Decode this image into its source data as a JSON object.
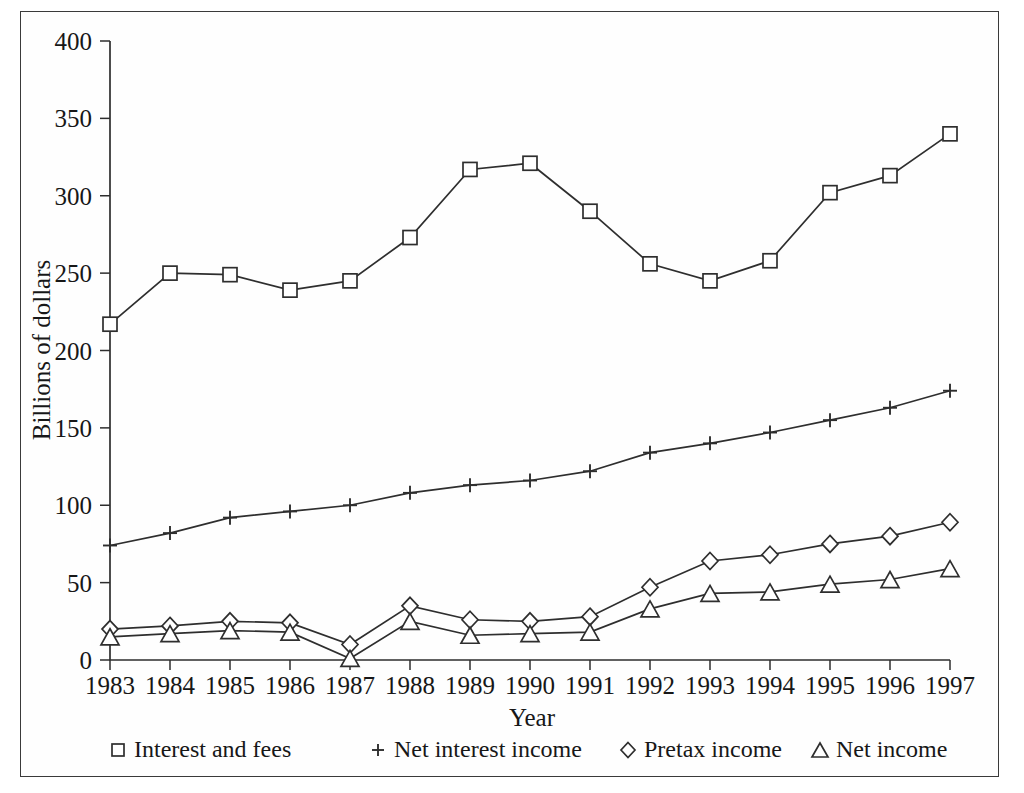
{
  "figure": {
    "y_axis_title": "Billions of dollars",
    "x_axis_title": "Year",
    "frame_color": "#3a3a3a",
    "line_color": "#2e2e2e",
    "background": "#ffffff"
  },
  "legend": {
    "position": "bottom",
    "entries": [
      {
        "label": "Interest and fees",
        "marker": "square-marker"
      },
      {
        "label": "Net interest income",
        "marker": "plus-marker"
      },
      {
        "label": "Pretax income",
        "marker": "diamond-marker"
      },
      {
        "label": "Net income",
        "marker": "triangle-marker"
      }
    ]
  },
  "axes": {
    "y_ticks": [
      "0",
      "50",
      "100",
      "150",
      "200",
      "250",
      "300",
      "350",
      "400"
    ],
    "x_ticks": [
      "1983",
      "1984",
      "1985",
      "1986",
      "1987",
      "1988",
      "1989",
      "1990",
      "1991",
      "1992",
      "1993",
      "1994",
      "1995",
      "1996",
      "1997"
    ]
  },
  "chart_data": {
    "type": "line",
    "title": "",
    "xlabel": "Year",
    "ylabel": "Billions of dollars",
    "x": [
      1983,
      1984,
      1985,
      1986,
      1987,
      1988,
      1989,
      1990,
      1991,
      1992,
      1993,
      1994,
      1995,
      1996,
      1997
    ],
    "categories": [
      "1983",
      "1984",
      "1985",
      "1986",
      "1987",
      "1988",
      "1989",
      "1990",
      "1991",
      "1992",
      "1993",
      "1994",
      "1995",
      "1996",
      "1997"
    ],
    "ylim": [
      0,
      400
    ],
    "xlim": [
      1983,
      1997
    ],
    "yticks": [
      0,
      50,
      100,
      150,
      200,
      250,
      300,
      350,
      400
    ],
    "grid": false,
    "legend_position": "bottom",
    "series": [
      {
        "name": "Interest and fees",
        "marker": "square",
        "values": [
          217,
          250,
          249,
          239,
          245,
          273,
          317,
          321,
          290,
          256,
          245,
          258,
          302,
          313,
          340
        ]
      },
      {
        "name": "Net interest income",
        "marker": "plus",
        "values": [
          74,
          82,
          92,
          96,
          100,
          108,
          113,
          116,
          122,
          134,
          140,
          147,
          155,
          163,
          174
        ]
      },
      {
        "name": "Pretax income",
        "marker": "diamond",
        "values": [
          20,
          22,
          25,
          24,
          10,
          35,
          26,
          25,
          28,
          47,
          64,
          68,
          75,
          80,
          89
        ]
      },
      {
        "name": "Net income",
        "marker": "triangle",
        "values": [
          15,
          17,
          19,
          18,
          1,
          25,
          16,
          17,
          18,
          33,
          43,
          44,
          49,
          52,
          59
        ]
      }
    ]
  }
}
